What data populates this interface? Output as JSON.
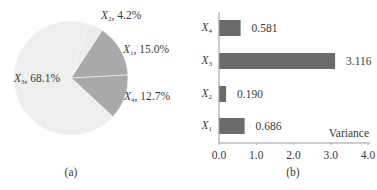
{
  "chart_data": [
    {
      "type": "pie",
      "caption": "(a)",
      "slices": [
        {
          "label": "X3",
          "name_base": "X",
          "name_sub": "3",
          "value": 68.1,
          "display": "68.1%",
          "color": "#eeeeee"
        },
        {
          "label": "X2",
          "name_base": "X",
          "name_sub": "2",
          "value": 4.2,
          "display": "4.2%",
          "color": "#ececec"
        },
        {
          "label": "X1",
          "name_base": "X",
          "name_sub": "1",
          "value": 15.0,
          "display": "15.0%",
          "color": "#a9a9a9"
        },
        {
          "label": "X4",
          "name_base": "X",
          "name_sub": "4",
          "value": 12.7,
          "display": "12.7%",
          "color": "#a9a9a9"
        }
      ]
    },
    {
      "type": "bar",
      "orientation": "horizontal",
      "caption": "(b)",
      "xlabel": "Variance",
      "ylabel": "",
      "xlim": [
        0.0,
        4.0
      ],
      "xticks": [
        "0.0",
        "1.0",
        "2.0",
        "3.0",
        "4.0"
      ],
      "grid": false,
      "categories": [
        "X4",
        "X3",
        "X2",
        "X1"
      ],
      "category_sub": [
        "4",
        "3",
        "2",
        "1"
      ],
      "values": [
        0.581,
        3.116,
        0.19,
        0.686
      ],
      "value_labels": [
        "0.581",
        "3.116",
        "0.190",
        "0.686"
      ],
      "bar_color": "#6b6b6b"
    }
  ]
}
